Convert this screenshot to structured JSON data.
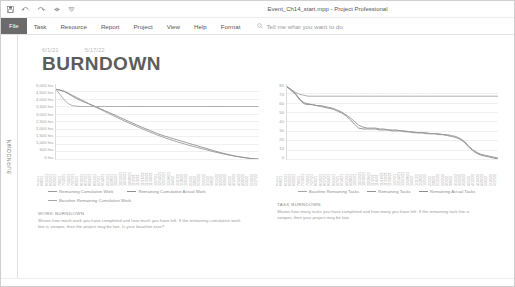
{
  "window": {
    "title": "Event_Ch14_start.mpp  -  Project Professional",
    "quick_access": [
      "save-icon",
      "undo-icon",
      "redo-icon",
      "link-icon",
      "customize-icon"
    ]
  },
  "ribbon": {
    "tabs": [
      {
        "label": "File",
        "active": true
      },
      {
        "label": "Task",
        "active": false
      },
      {
        "label": "Resource",
        "active": false
      },
      {
        "label": "Report",
        "active": false
      },
      {
        "label": "Project",
        "active": false
      },
      {
        "label": "View",
        "active": false
      },
      {
        "label": "Help",
        "active": false
      },
      {
        "label": "Format",
        "active": false
      }
    ],
    "tell_me": "Tell me what you want to do",
    "tell_me_icon": "magnifier-icon"
  },
  "side_tab": {
    "label": "BURNDOWN"
  },
  "report": {
    "date_start": "6/1/21",
    "date_end": "5/17/22",
    "title": "BURNDOWN"
  },
  "chart_data": [
    {
      "type": "line",
      "title": "WORK BURNDOWN",
      "xlabel": "",
      "ylabel": "",
      "ylim": [
        0,
        5000
      ],
      "ytick_labels": [
        "5,000 hrs",
        "4,500 hrs",
        "4,000 hrs",
        "3,500 hrs",
        "3,000 hrs",
        "2,500 hrs",
        "2,000 hrs",
        "1,500 hrs",
        "1,000 hrs",
        "500 hrs",
        "0 hrs"
      ],
      "grid": true,
      "legend_position": "bottom",
      "categories": [
        "6/1/21",
        "6/8/21",
        "6/15/21",
        "6/22/21",
        "6/29/21",
        "7/6/21",
        "7/13/21",
        "7/20/21",
        "7/27/21",
        "8/3/21",
        "8/10/21",
        "8/17/21",
        "8/24/21",
        "8/31/21",
        "9/7/21",
        "9/14/21",
        "9/21/21",
        "9/28/21",
        "10/5/21",
        "10/12/21",
        "10/19/21",
        "10/26/21",
        "11/2/21",
        "11/9/21",
        "11/16/21",
        "11/23/21",
        "11/30/21",
        "12/7/21",
        "12/14/21",
        "12/21/21",
        "12/28/21",
        "1/4/22",
        "1/11/22",
        "1/18/22",
        "1/25/22",
        "2/1/22",
        "2/8/22",
        "2/15/22",
        "2/22/22",
        "3/1/22",
        "3/8/22",
        "3/15/22",
        "3/22/22",
        "3/29/22",
        "4/5/22",
        "4/12/22",
        "4/19/22",
        "4/26/22",
        "5/3/22",
        "5/10/22",
        "5/17/22"
      ],
      "series": [
        {
          "name": "Remaining Cumulative Work",
          "color": "#9b9b9b",
          "values": [
            4650,
            4600,
            4520,
            4400,
            4250,
            4120,
            3980,
            3850,
            3700,
            3560,
            3430,
            3300,
            3170,
            3040,
            2910,
            2780,
            2650,
            2520,
            2400,
            2280,
            2160,
            2040,
            1930,
            1820,
            1710,
            1600,
            1500,
            1400,
            1310,
            1220,
            1140,
            1060,
            980,
            900,
            830,
            760,
            690,
            620,
            550,
            480,
            420,
            360,
            300,
            250,
            200,
            160,
            120,
            80,
            40,
            10,
            0
          ]
        },
        {
          "name": "Remaining Cumulative Actual Work",
          "color": "#8f8f8f",
          "values": [
            4650,
            4590,
            4500,
            4360,
            4190,
            4040,
            3900,
            3790,
            3690,
            3580,
            3470,
            3350,
            3230,
            3110,
            2990,
            2870,
            2750,
            2620,
            2500,
            2380,
            2260,
            2140,
            2030,
            1920,
            1810,
            1700,
            1600,
            1510,
            1430,
            1350,
            1270,
            1190,
            1110,
            1030,
            950,
            870,
            790,
            710,
            630,
            550,
            470,
            400,
            330,
            270,
            210,
            160,
            110,
            70,
            35,
            10,
            0
          ]
        },
        {
          "name": "Baseline Remaining Cumulative Work",
          "color": "#a6a6a6",
          "values": [
            4650,
            4300,
            3950,
            3700,
            3560,
            3520,
            3500,
            3500,
            3500,
            3500,
            3500,
            3500,
            3500,
            3500,
            3500,
            3500,
            3500,
            3500,
            3500,
            3500,
            3500,
            3500,
            3500,
            3500,
            3500,
            3500,
            3500,
            3500,
            3500,
            3500,
            3500,
            3500,
            3500,
            3500,
            3500,
            3500,
            3500,
            3500,
            3500,
            3500,
            3500,
            3500,
            3500,
            3500,
            3500,
            3500,
            3500,
            3500,
            3500,
            3500,
            3500
          ]
        }
      ],
      "caption_title": "WORK BURNDOWN",
      "caption_body": "Shows how much work you have completed and how much you have left. If the remaining cumulative work line is steeper, then the project may be late. Is your baseline zero?"
    },
    {
      "type": "line",
      "title": "TASK BURNDOWN",
      "xlabel": "",
      "ylabel": "",
      "ylim": [
        0,
        80
      ],
      "ytick_labels": [
        "80",
        "70",
        "60",
        "50",
        "40",
        "30",
        "20",
        "10",
        "0"
      ],
      "grid": true,
      "legend_position": "bottom",
      "categories": [
        "6/1/21",
        "6/8/21",
        "6/15/21",
        "6/22/21",
        "6/29/21",
        "7/6/21",
        "7/13/21",
        "7/20/21",
        "7/27/21",
        "8/3/21",
        "8/10/21",
        "8/17/21",
        "8/24/21",
        "8/31/21",
        "9/7/21",
        "9/14/21",
        "9/21/21",
        "9/28/21",
        "10/5/21",
        "10/12/21",
        "10/19/21",
        "10/26/21",
        "11/2/21",
        "11/9/21",
        "11/16/21",
        "11/23/21",
        "11/30/21",
        "12/7/21",
        "12/14/21",
        "12/21/21",
        "12/28/21",
        "1/4/22",
        "1/11/22",
        "1/18/22",
        "1/25/22",
        "2/1/22",
        "2/8/22",
        "2/15/22",
        "2/22/22",
        "3/1/22",
        "3/8/22",
        "3/15/22",
        "3/22/22",
        "3/29/22",
        "4/5/22",
        "4/12/22",
        "4/19/22",
        "4/26/22",
        "5/3/22",
        "5/10/22",
        "5/17/22"
      ],
      "series": [
        {
          "name": "Baseline Remaining Tasks",
          "color": "#a6a6a6",
          "values": [
            77,
            74,
            71,
            69,
            68,
            67,
            67,
            67,
            67,
            67,
            67,
            67,
            67,
            67,
            67,
            67,
            67,
            67,
            67,
            67,
            67,
            67,
            67,
            67,
            67,
            67,
            67,
            67,
            67,
            67,
            67,
            67,
            67,
            67,
            67,
            67,
            67,
            67,
            67,
            67,
            67,
            67,
            67,
            67,
            67,
            67,
            67,
            67,
            67,
            67,
            67
          ]
        },
        {
          "name": "Remaining Tasks",
          "color": "#949494",
          "values": [
            77,
            74,
            70,
            64,
            60,
            59,
            58,
            57,
            57,
            56,
            55,
            54,
            52,
            50,
            47,
            44,
            40,
            36,
            34,
            33,
            33,
            33,
            32,
            32,
            31,
            31,
            31,
            30,
            30,
            29,
            29,
            28,
            28,
            28,
            27,
            27,
            27,
            26,
            26,
            25,
            24,
            22,
            19,
            14,
            10,
            7,
            5,
            4,
            3,
            2,
            1
          ]
        },
        {
          "name": "Remaining Actual Tasks",
          "color": "#8c8c8c",
          "values": [
            77,
            73,
            69,
            63,
            59,
            58,
            58,
            57,
            56,
            55,
            54,
            53,
            51,
            49,
            46,
            42,
            37,
            33,
            32,
            32,
            32,
            32,
            31,
            31,
            31,
            30,
            30,
            30,
            29,
            29,
            28,
            28,
            28,
            27,
            27,
            27,
            26,
            26,
            25,
            24,
            23,
            21,
            18,
            13,
            9,
            6,
            4,
            3,
            2,
            1,
            0
          ]
        }
      ],
      "caption_title": "TASK BURNDOWN",
      "caption_body": "Shows how many tasks you have completed and how many you have left. If the remaining task line is steeper, then your project may be late."
    }
  ]
}
